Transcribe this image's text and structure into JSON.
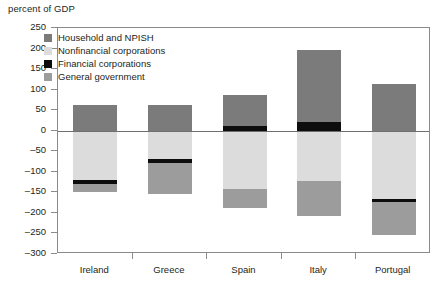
{
  "chart_data": {
    "type": "bar",
    "title": "",
    "ylabel": "percent of GDP",
    "xlabel": "",
    "ylim": [
      -300,
      250
    ],
    "ytick_step": 50,
    "yticks": [
      250,
      200,
      150,
      100,
      50,
      0,
      -50,
      -100,
      -150,
      -200,
      -250,
      -300
    ],
    "ytick_labels": [
      "250",
      "200",
      "150",
      "100",
      "50",
      "0",
      "–50",
      "–100",
      "–150",
      "–200",
      "–250",
      "–300"
    ],
    "grid": false,
    "zero_line": true,
    "stacked": true,
    "legend_position": "inside-top-left",
    "categories": [
      "Ireland",
      "Greece",
      "Spain",
      "Italy",
      "Portugal"
    ],
    "series": [
      {
        "name": "Household and NPISH",
        "color": "#7b7b7b",
        "values": [
          63,
          63,
          75,
          197,
          113
        ]
      },
      {
        "name": "Nonfinancial corporations",
        "color": "#dcdcdc",
        "values": [
          -119,
          -70,
          -143,
          -123,
          -165
        ]
      },
      {
        "name": "Financial corporations",
        "color": "#0d0d0d",
        "values": [
          -10,
          -8,
          12,
          22,
          -8
        ]
      },
      {
        "name": "General government",
        "color": "#9c9c9c",
        "values": [
          -20,
          -75,
          -45,
          -85,
          -80
        ]
      }
    ],
    "bar_segments": [
      {
        "category": "Ireland",
        "segments": [
          {
            "series": "Household and NPISH",
            "from": 0,
            "to": 63,
            "color": "#7b7b7b"
          },
          {
            "series": "Nonfinancial corporations",
            "from": 0,
            "to": -119,
            "color": "#dcdcdc"
          },
          {
            "series": "Financial corporations",
            "from": -119,
            "to": -129,
            "color": "#0d0d0d"
          },
          {
            "series": "General government",
            "from": -129,
            "to": -149,
            "color": "#9c9c9c"
          }
        ]
      },
      {
        "category": "Greece",
        "segments": [
          {
            "series": "Household and NPISH",
            "from": 0,
            "to": 63,
            "color": "#7b7b7b"
          },
          {
            "series": "Nonfinancial corporations",
            "from": 0,
            "to": -70,
            "color": "#dcdcdc"
          },
          {
            "series": "Financial corporations",
            "from": -70,
            "to": -78,
            "color": "#0d0d0d"
          },
          {
            "series": "General government",
            "from": -78,
            "to": -153,
            "color": "#9c9c9c"
          }
        ]
      },
      {
        "category": "Spain",
        "segments": [
          {
            "series": "Household and NPISH",
            "from": 12,
            "to": 87,
            "color": "#7b7b7b"
          },
          {
            "series": "Financial corporations",
            "from": 0,
            "to": 12,
            "color": "#0d0d0d"
          },
          {
            "series": "Nonfinancial corporations",
            "from": 0,
            "to": -143,
            "color": "#dcdcdc"
          },
          {
            "series": "General government",
            "from": -143,
            "to": -188,
            "color": "#9c9c9c"
          }
        ]
      },
      {
        "category": "Italy",
        "segments": [
          {
            "series": "Household and NPISH",
            "from": 22,
            "to": 197,
            "color": "#7b7b7b"
          },
          {
            "series": "Financial corporations",
            "from": 0,
            "to": 22,
            "color": "#0d0d0d"
          },
          {
            "series": "Nonfinancial corporations",
            "from": 0,
            "to": -123,
            "color": "#dcdcdc"
          },
          {
            "series": "General government",
            "from": -123,
            "to": -208,
            "color": "#9c9c9c"
          }
        ]
      },
      {
        "category": "Portugal",
        "segments": [
          {
            "series": "Household and NPISH",
            "from": 0,
            "to": 113,
            "color": "#7b7b7b"
          },
          {
            "series": "Nonfinancial corporations",
            "from": 0,
            "to": -165,
            "color": "#dcdcdc"
          },
          {
            "series": "Financial corporations",
            "from": -165,
            "to": -173,
            "color": "#0d0d0d"
          },
          {
            "series": "General government",
            "from": -173,
            "to": -253,
            "color": "#9c9c9c"
          }
        ]
      }
    ]
  },
  "legend": {
    "items": [
      {
        "label": "Household and NPISH",
        "color": "#7b7b7b"
      },
      {
        "label": "Nonfinancial corporations",
        "color": "#dcdcdc"
      },
      {
        "label": "Financial corporations",
        "color": "#0d0d0d"
      },
      {
        "label": "General government",
        "color": "#9c9c9c"
      }
    ]
  },
  "axes": {
    "y_title": "percent of GDP"
  }
}
